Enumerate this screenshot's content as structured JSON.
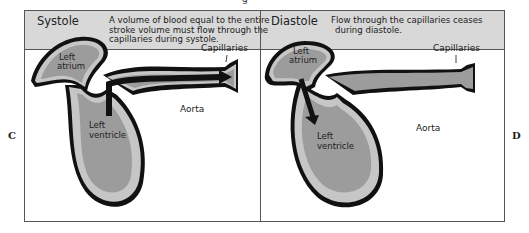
{
  "caption_fragment": "g",
  "side_labels": {
    "left": "C",
    "right": "D"
  },
  "panels": [
    {
      "title": "Systole",
      "description_lines": [
        "A volume of blood equal to the entire",
        "stroke volume must flow through the",
        "capillaries during systole."
      ],
      "labels": {
        "capillaries": "Capillaries",
        "left_atrium_1": "Left",
        "left_atrium_2": "atrium",
        "left_ventricle_1": "Left",
        "left_ventricle_2": "ventricle",
        "aorta": "Aorta"
      }
    },
    {
      "title": "Diastole",
      "description_lines": [
        "Flow through the capillaries ceases",
        "during diastole."
      ],
      "labels": {
        "capillaries": "Capillaries",
        "left_atrium_1": "Left",
        "left_atrium_2": "atrium",
        "left_ventricle_1": "Left",
        "left_ventricle_2": "ventricle",
        "aorta": "Aorta"
      }
    }
  ],
  "colors": {
    "header_bg": "#d8d8d8",
    "chamber_fill": "#9c9c9c",
    "wall_fill": "#c6c6c6",
    "outline": "#111111"
  }
}
